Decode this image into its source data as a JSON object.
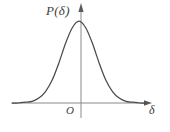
{
  "figure": {
    "background_color": "#ffffff",
    "curve_color": "#4a4a4a",
    "axis_color": "#8a8a8a",
    "text_color": "#3d3d3d",
    "ylabel": "P(δ)",
    "xlabel": "δ",
    "origin_label": "O"
  },
  "chart_data": {
    "type": "line",
    "title": "",
    "subtitle": "",
    "xlabel": "δ",
    "ylabel": "P(δ)",
    "legend": [],
    "grid": false,
    "annotations": [
      "O"
    ],
    "axis_arrows": {
      "x": "right",
      "y": "up"
    },
    "xlim": [
      -4,
      4
    ],
    "ylim": [
      0,
      1
    ],
    "xticks": [],
    "yticks": [],
    "series": [
      {
        "name": "P(δ)",
        "x": [
          -4.0,
          -3.6,
          -3.2,
          -2.8,
          -2.4,
          -2.0,
          -1.6,
          -1.2,
          -0.8,
          -0.4,
          0.0,
          0.4,
          0.8,
          1.2,
          1.6,
          2.0,
          2.4,
          2.8,
          3.2,
          3.6,
          4.0
        ],
        "values": [
          0.0,
          0.0,
          0.01,
          0.02,
          0.06,
          0.14,
          0.28,
          0.49,
          0.73,
          0.92,
          1.0,
          0.92,
          0.73,
          0.49,
          0.28,
          0.14,
          0.06,
          0.02,
          0.01,
          0.0,
          0.0
        ]
      }
    ]
  }
}
